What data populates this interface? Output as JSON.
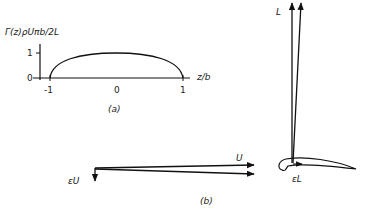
{
  "figure": {
    "panel_a": {
      "ylabel": "Γ(z)ρUπb/2L",
      "xlabel": "z/b",
      "y_ticks": [
        "1",
        "0"
      ],
      "x_ticks": [
        "-1",
        "0",
        "1"
      ],
      "caption": "(a)",
      "curve": "elliptic distribution, zero at z/b = ±1, value 1 at z/b = 0"
    },
    "panel_b": {
      "velocity_label": "U",
      "downwash_label": "εU",
      "lift_label": "L",
      "induced_drag_label": "εL",
      "caption": "(b)"
    }
  }
}
